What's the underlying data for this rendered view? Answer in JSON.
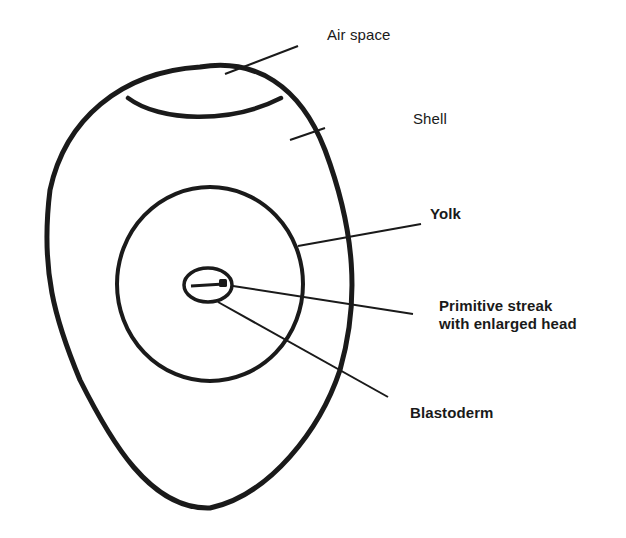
{
  "diagram": {
    "stroke_color": "#1a1a1a",
    "background_color": "#ffffff",
    "parts": [
      {
        "id": "air-space",
        "label": "Air space"
      },
      {
        "id": "shell",
        "label": "Shell"
      },
      {
        "id": "yolk",
        "label": "Yolk"
      },
      {
        "id": "primitive-streak",
        "label_line1": "Primitive streak",
        "label_line2": "with enlarged head"
      },
      {
        "id": "blastoderm",
        "label": "Blastoderm"
      }
    ]
  }
}
